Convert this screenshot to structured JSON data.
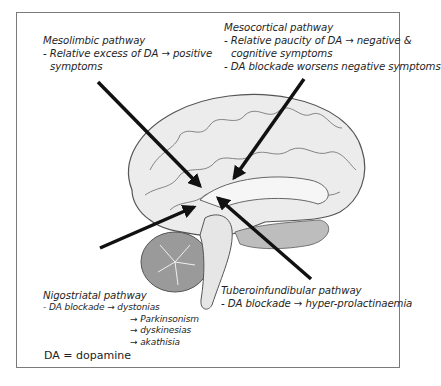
{
  "figure": {
    "type": "diagram",
    "labels": {
      "mesolimbic": {
        "title": "Mesolimbic pathway",
        "lines": [
          "- Relative excess of DA → positive",
          "symptoms"
        ]
      },
      "mesocortical": {
        "title": "Mesocortical pathway",
        "lines": [
          "- Relative paucity of DA → negative &",
          "cognitive symptoms",
          "- DA blockade worsens negative symptoms"
        ]
      },
      "nigrostriatal": {
        "title": "Nigostriatal pathway",
        "first_line": "- DA blockade → dystonias",
        "more": [
          "→ Parkinsonism",
          "→ dyskinesias",
          "→ akathisia"
        ]
      },
      "tuberoinfundibular": {
        "title": "Tuberoinfundibular pathway",
        "lines": [
          "- DA blockade → hyper-prolactinaemia"
        ]
      }
    },
    "legend": "DA = dopamine",
    "colors": {
      "arrow": "#111111",
      "frame": "#7a7a7a",
      "brain_fill": "#e8e8e8",
      "brain_outline": "#555555",
      "cerebellum": "#9a9a9a"
    }
  }
}
